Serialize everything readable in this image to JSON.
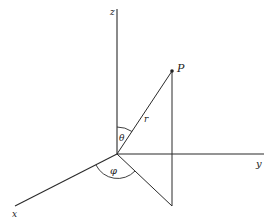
{
  "diagram": {
    "labels": {
      "z_axis": "z",
      "y_axis": "y",
      "x_axis": "x",
      "point": "P",
      "radius": "r",
      "polar_angle": "θ",
      "azimuthal_angle": "φ"
    },
    "colors": {
      "line": "#2a2a2a",
      "text": "#222222",
      "background": "#ffffff"
    }
  }
}
